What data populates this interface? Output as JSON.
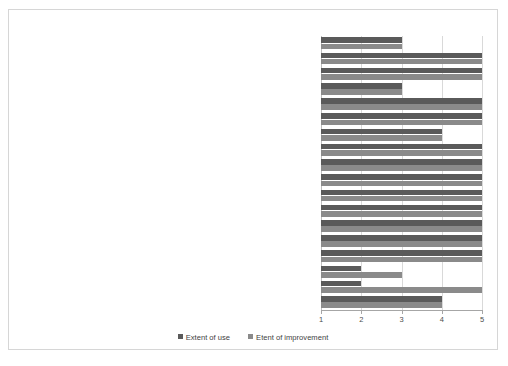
{
  "chart_data": {
    "type": "bar",
    "orientation": "horizontal",
    "title": "",
    "xlabel": "",
    "ylabel": "",
    "xlim": [
      1,
      5
    ],
    "xticks": [
      "1",
      "2",
      "3",
      "4",
      "5"
    ],
    "grid": true,
    "legend_position": "bottom",
    "colors": {
      "extent_of_use": "#5a5a5a",
      "etent_of_improvement": "#8a8a8a",
      "gridline": "#d9d9d9",
      "axis": "#a6a6a6",
      "frame_border": "#d6d6d6",
      "background": "#ffffff",
      "text": "#3f3f3f"
    },
    "categories": [
      "Building maintenance plans",
      "Documentation strategy",
      "Transport management plans",
      "Office site (compounds, access roads and parking space)…",
      "ICT systems (hardware and software)",
      "Housekeeping strategy",
      "Facility management policy",
      "Procedures to manage stores (monitor stock levels, evaluate…",
      "Purchasing committee",
      "Tender/contracts committee",
      "Tender procedures",
      "Price investigation plans",
      "Purchasing (procurement) strategy",
      "Cash administration system",
      "Financial reporting frameworks (cash flow statements, income…",
      "Audit plan /schedule",
      "Financial accounting system (book keeping, ledger)",
      "Budget planning and monitoring procedures"
    ],
    "series": [
      {
        "name": "Extent of use",
        "values": [
          3,
          5,
          5,
          3,
          5,
          5,
          4,
          5,
          5,
          5,
          5,
          5,
          5,
          5,
          5,
          2,
          2,
          4
        ]
      },
      {
        "name": "Etent of improvement",
        "values": [
          3,
          5,
          5,
          3,
          5,
          5,
          4,
          5,
          5,
          5,
          5,
          5,
          5,
          5,
          5,
          3,
          5,
          4
        ]
      }
    ]
  },
  "legend": {
    "items": [
      {
        "label": "Extent of use"
      },
      {
        "label": "Etent of improvement"
      }
    ]
  }
}
